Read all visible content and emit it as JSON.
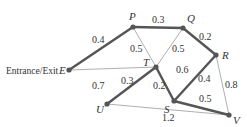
{
  "diagram": {
    "title": "",
    "entrance_label": "Entrance/Exit",
    "colors": {
      "thick_edge": "#555555",
      "thin_edge": "#999999",
      "node": "#555555",
      "text": "#333333"
    },
    "nodes": [
      {
        "id": "P",
        "label": "P",
        "x": 133,
        "y": 27
      },
      {
        "id": "Q",
        "label": "Q",
        "x": 183,
        "y": 28
      },
      {
        "id": "R",
        "label": "R",
        "x": 216,
        "y": 55
      },
      {
        "id": "E",
        "label": "E",
        "x": 69,
        "y": 70
      },
      {
        "id": "T",
        "label": "T",
        "x": 156,
        "y": 67
      },
      {
        "id": "S",
        "label": "S",
        "x": 174,
        "y": 101
      },
      {
        "id": "U",
        "label": "U",
        "x": 107,
        "y": 104
      },
      {
        "id": "V",
        "label": "V",
        "x": 229,
        "y": 115
      }
    ],
    "edges": [
      {
        "from": "E",
        "to": "P",
        "weight": "0.4",
        "style": "thick"
      },
      {
        "from": "P",
        "to": "Q",
        "weight": "0.3",
        "style": "thick"
      },
      {
        "from": "Q",
        "to": "R",
        "weight": "0.2",
        "style": "thick"
      },
      {
        "from": "P",
        "to": "T",
        "weight": "0.5",
        "style": "thin"
      },
      {
        "from": "Q",
        "to": "T",
        "weight": "0.5",
        "style": "thin"
      },
      {
        "from": "E",
        "to": "T",
        "weight": "0.7",
        "style": "thin"
      },
      {
        "from": "T",
        "to": "U",
        "weight": "0.3",
        "style": "thick"
      },
      {
        "from": "T",
        "to": "S",
        "weight": "0.2",
        "style": "thick"
      },
      {
        "from": "S",
        "to": "R",
        "weight": "0.4",
        "style": "thick"
      },
      {
        "from": "S",
        "to": "V",
        "weight": "0.5",
        "style": "thick"
      },
      {
        "from": "R",
        "to": "V",
        "weight": "0.8",
        "style": "thin"
      },
      {
        "from": "U",
        "to": "V",
        "weight": "1.2",
        "style": "thin"
      }
    ],
    "weight_labels": {
      "EP": "0.4",
      "PQ": "0.3",
      "QR": "0.2",
      "PT": "0.5",
      "QT": "0.5",
      "ET": "0.7",
      "TU": "0.3",
      "TS": "0.2",
      "SR_upper": "0.6",
      "SR": "0.4",
      "SV": "0.5",
      "RV": "0.8",
      "UV": "1.2"
    }
  }
}
